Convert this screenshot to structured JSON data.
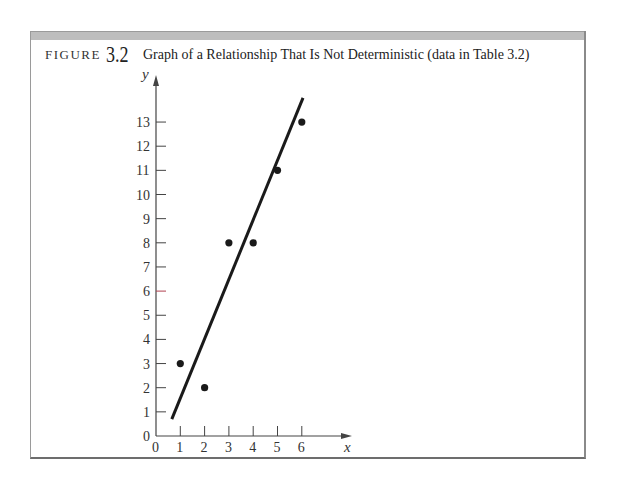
{
  "figure": {
    "label": "FIGURE",
    "number": "3.2",
    "title": "Graph of a Relationship That Is Not Deterministic (data in Table 3.2)"
  },
  "colors": {
    "frame_bar": "#bdbdbd",
    "line": "#1a1a1a",
    "point": "#1a1a1a",
    "axis": "#444444",
    "highlight_tick": "#b04050"
  },
  "chart_data": {
    "type": "scatter",
    "title": "Graph of a Relationship That Is Not Deterministic (data in Table 3.2)",
    "xlabel": "x",
    "ylabel": "y",
    "xlim": [
      0,
      7
    ],
    "ylim": [
      0,
      14
    ],
    "x_ticks": [
      0,
      1,
      2,
      3,
      4,
      5,
      6
    ],
    "y_ticks": [
      0,
      1,
      2,
      3,
      4,
      5,
      6,
      7,
      8,
      9,
      10,
      11,
      12,
      13
    ],
    "grid": false,
    "legend": null,
    "series": [
      {
        "name": "observations",
        "type": "scatter",
        "x": [
          1,
          2,
          3,
          4,
          5,
          6
        ],
        "y": [
          3,
          2,
          8,
          8,
          11,
          13
        ]
      },
      {
        "name": "fitted line",
        "type": "line",
        "x": [
          0.65,
          6.05
        ],
        "y": [
          0.7,
          14.0
        ]
      }
    ]
  }
}
